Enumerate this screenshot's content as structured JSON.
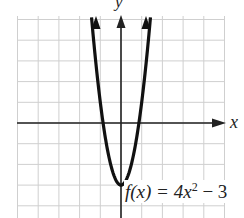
{
  "chart_data": {
    "type": "line",
    "title": "",
    "function": "f(x) = 4x^2 - 3",
    "xlabel": "x",
    "ylabel": "y",
    "xlim": [
      -5,
      5
    ],
    "ylim": [
      -4,
      5
    ],
    "grid": true,
    "grid_step": 1,
    "series": [
      {
        "name": "f(x) = 4x^2 - 3",
        "x": [
          -1.25,
          -1,
          -0.866,
          -0.5,
          0,
          0.5,
          0.866,
          1,
          1.25
        ],
        "y": [
          3.25,
          1,
          0,
          -2,
          -3,
          -2,
          0,
          1,
          3.25
        ]
      }
    ],
    "annotations": [
      "f(x) = 4x² − 3"
    ],
    "vertex": [
      0,
      -3
    ],
    "x_intercepts": [
      -0.866,
      0.866
    ]
  },
  "labels": {
    "y_axis": "y",
    "x_axis": "x",
    "func_prefix": "f(x) = 4x",
    "func_exp": "2",
    "func_suffix": " − 3"
  },
  "colors": {
    "curve": "#111111",
    "grid": "#c8c8c8",
    "axis": "#222222"
  }
}
